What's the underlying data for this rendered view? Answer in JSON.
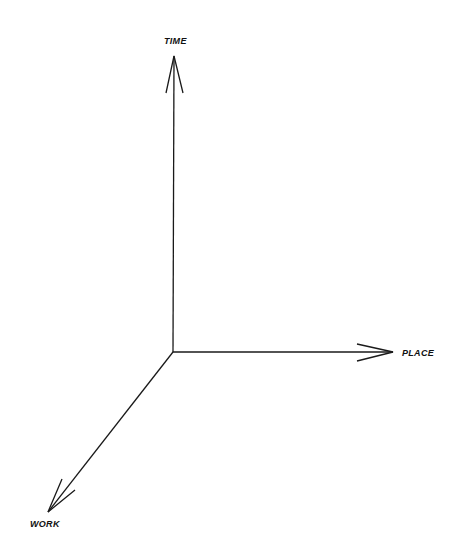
{
  "diagram": {
    "type": "3d-axes",
    "line_color": "#1a1a1a",
    "origin": {
      "x": 173,
      "y": 352
    },
    "axes": [
      {
        "id": "time",
        "label": "TIME",
        "direction": "up",
        "end": {
          "x": 174,
          "y": 56
        },
        "barbs": [
          {
            "x": 166,
            "y": 93
          },
          {
            "x": 183,
            "y": 93
          }
        ],
        "label_pos": {
          "x": 164,
          "y": 44
        }
      },
      {
        "id": "place",
        "label": "PLACE",
        "direction": "right",
        "end": {
          "x": 393,
          "y": 352
        },
        "barbs": [
          {
            "x": 357,
            "y": 344
          },
          {
            "x": 357,
            "y": 361
          }
        ],
        "label_pos": {
          "x": 402,
          "y": 356
        }
      },
      {
        "id": "work",
        "label": "WORK",
        "direction": "down-left",
        "end": {
          "x": 48,
          "y": 512
        },
        "barbs": [
          {
            "x": 62,
            "y": 479
          },
          {
            "x": 75,
            "y": 490
          }
        ],
        "label_pos": {
          "x": 30,
          "y": 527
        }
      }
    ]
  }
}
